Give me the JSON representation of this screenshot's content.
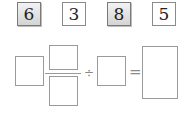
{
  "cards": [
    {
      "value": "6",
      "shaded": true
    },
    {
      "value": "3",
      "shaded": false
    },
    {
      "value": "8",
      "shaded": true
    },
    {
      "value": "5",
      "shaded": false
    }
  ],
  "equation": {
    "divide_symbol": "÷",
    "equals_symbol": "=",
    "boxes": [
      "whole-number",
      "numerator",
      "denominator",
      "divisor",
      "result"
    ]
  },
  "colors": {
    "card_border": "#8a8a8a",
    "card_shaded": "#d4d4d4",
    "box_border": "#9a9a9a"
  }
}
